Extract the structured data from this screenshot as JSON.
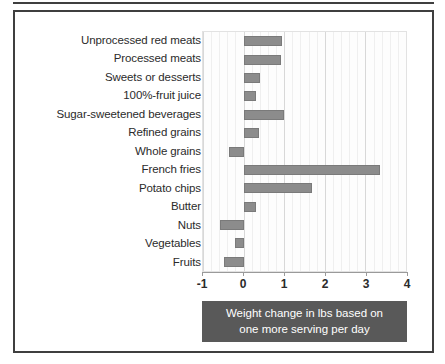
{
  "chart_data": {
    "type": "bar",
    "orientation": "horizontal",
    "title": "",
    "caption": "Weight change in lbs based on one more serving per day",
    "xlabel": "",
    "ylabel": "",
    "xlim": [
      -1,
      4
    ],
    "xticks": [
      -1,
      0,
      1,
      2,
      3,
      4
    ],
    "xtick_labels": [
      "-1",
      "0",
      "1",
      "2",
      "3",
      "4"
    ],
    "grid": true,
    "legend": false,
    "bar_color": "#8c8c8c",
    "categories": [
      "Unprocessed red meats",
      "Processed meats",
      "Sweets or desserts",
      "100%-fruit juice",
      "Sugar-sweetened beverages",
      "Refined grains",
      "Whole grains",
      "French fries",
      "Potato chips",
      "Butter",
      "Nuts",
      "Vegetables",
      "Fruits"
    ],
    "values": [
      0.95,
      0.93,
      0.41,
      0.31,
      1.0,
      0.39,
      -0.37,
      3.35,
      1.69,
      0.3,
      -0.57,
      -0.22,
      -0.49
    ]
  },
  "caption": {
    "line1": "Weight change in lbs based on",
    "line2": "one more serving per day"
  }
}
